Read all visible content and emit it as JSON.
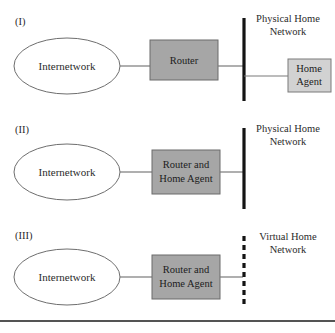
{
  "figure": {
    "background_color": "#ffffff",
    "colors": {
      "router_fill": "#a6a6a6",
      "home_agent_fill": "#d2d2d2",
      "shape_stroke": "#6e6e6e",
      "network_bar": "#141414",
      "link_line": "#7a7a7a"
    }
  },
  "panels": [
    {
      "label": "(I)",
      "cloud": "Internetwork",
      "router": "Router",
      "home_agent": "Home Agent",
      "home_agent_line1": "Home",
      "home_agent_line2": "Agent",
      "network_line1": "Physical Home",
      "network_line2": "Network",
      "network_style": "solid"
    },
    {
      "label": "(II)",
      "cloud": "Internetwork",
      "router": "Router and Home Agent",
      "router_line1": "Router and",
      "router_line2": "Home Agent",
      "network_line1": "Physical Home",
      "network_line2": "Network",
      "network_style": "solid"
    },
    {
      "label": "(III)",
      "cloud": "Internetwork",
      "router": "Router and Home Agent",
      "router_line1": "Router and",
      "router_line2": "Home Agent",
      "network_line1": "Virtual Home",
      "network_line2": "Network",
      "network_style": "dashed"
    }
  ]
}
